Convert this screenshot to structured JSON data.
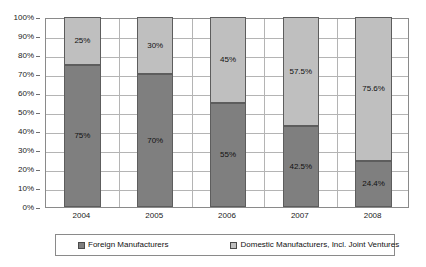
{
  "chart_data": {
    "type": "bar",
    "stacked": true,
    "stack_total": 100,
    "title": "",
    "subtitle": "",
    "xlabel": "",
    "ylabel": "",
    "categories": [
      "2004",
      "2005",
      "2006",
      "2007",
      "2008"
    ],
    "series": [
      {
        "name": "Foreign Manufacturers",
        "color": "#7f7f7f",
        "values": [
          75,
          70,
          55,
          42.5,
          24.4
        ],
        "labels": [
          "75%",
          "70%",
          "55%",
          "42.5%",
          "24.4%"
        ]
      },
      {
        "name": "Domestic Manufacturers, Incl. Joint Ventures",
        "color": "#bfbfbf",
        "values": [
          25,
          30,
          45,
          57.5,
          75.6
        ],
        "labels": [
          "25%",
          "30%",
          "45%",
          "57.5%",
          "75.6%"
        ]
      }
    ],
    "ylim": [
      0,
      100
    ],
    "y_tick_values": [
      0,
      10,
      20,
      30,
      40,
      50,
      60,
      70,
      80,
      90,
      100
    ],
    "y_tick_labels": [
      "0%",
      "10%",
      "20%",
      "30%",
      "40%",
      "50%",
      "60%",
      "70%",
      "80%",
      "90%",
      "100%"
    ],
    "grid": {
      "horizontal": true,
      "vertical": true,
      "color": "#b4b4b4"
    },
    "legend": {
      "position": "bottom",
      "entries": [
        {
          "label": "Foreign Manufacturers",
          "color": "#7f7f7f"
        },
        {
          "label": "Domestic Manufacturers, Incl. Joint Ventures",
          "color": "#bfbfbf"
        }
      ]
    },
    "plot_background": "#ffffff",
    "axis_color": "#8a8a8a"
  }
}
